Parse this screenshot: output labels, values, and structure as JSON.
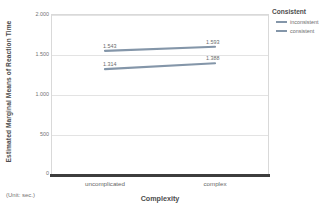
{
  "chart_data": {
    "type": "line",
    "title": "",
    "xlabel": "Complexity",
    "ylabel": "Estimated Marginal Means of Reaction Time",
    "categories": [
      "uncomplicated",
      "complex"
    ],
    "series": [
      {
        "name": "inconsistent",
        "values": [
          1.543,
          1.593
        ],
        "labels": [
          "1.543",
          "1.593"
        ],
        "color": "#8496a9"
      },
      {
        "name": "consistent",
        "values": [
          1.314,
          1.388
        ],
        "labels": [
          "1.314",
          "1.388"
        ],
        "color": "#8496a9"
      }
    ],
    "ylim": [
      0,
      2000
    ],
    "yticks": [
      2000,
      1500,
      1000,
      500,
      0
    ],
    "ytick_labels": [
      "2.000",
      "1.500",
      "1.000",
      "500",
      "0"
    ],
    "grid": true,
    "legend_position": "right",
    "note": "(Unit: sec.)"
  },
  "legend": {
    "title": "Consistent",
    "items": [
      {
        "label": "inconsistent"
      },
      {
        "label": "consistent"
      }
    ]
  },
  "axes": {
    "y_title": "Estimated Marginal Means of Reaction Time",
    "x_title": "Complexity",
    "y_tick_0": "2.000",
    "y_tick_1": "1.500",
    "y_tick_2": "1.000",
    "y_tick_3": "500",
    "y_tick_4": "0",
    "x_tick_0": "uncomplicated",
    "x_tick_1": "complex"
  },
  "labels": {
    "p_inconsistent_left": "1.543",
    "p_inconsistent_right": "1.593",
    "p_consistent_left": "1.314",
    "p_consistent_right": "1.388"
  },
  "footnote": {
    "unit": "(Unit: sec.)"
  }
}
